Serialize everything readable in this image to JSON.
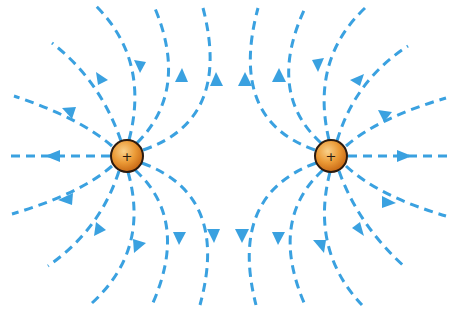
{
  "diagram": {
    "colors": {
      "field_line": "#3aa1e0",
      "charge_fill": "#e8902a",
      "charge_highlight": "#f7c878",
      "charge_outline": "#2a1a10",
      "background": "#ffffff"
    },
    "charges": [
      {
        "id": "left",
        "sign": "+",
        "cx": 127,
        "cy": 156,
        "r": 16
      },
      {
        "id": "right",
        "sign": "+",
        "cx": 331,
        "cy": 156,
        "r": 16
      }
    ],
    "field_line_direction": "outward from both charges",
    "field_lines_per_charge": 12
  }
}
